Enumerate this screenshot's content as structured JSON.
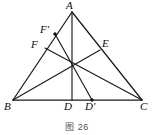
{
  "figure": {
    "caption": "图 26",
    "stroke_color": "#1a1a1a",
    "background_color": "#ffffff",
    "point_marker_color": "#111111",
    "labels": {
      "A": "A",
      "B": "B",
      "C": "C",
      "D": "D",
      "D_prime": "D'",
      "E": "E",
      "F": "F",
      "F_prime": "F'"
    },
    "points": [
      {
        "name": "A",
        "label": "A",
        "x": 72,
        "y": 12,
        "label_x": 68,
        "label_y": 0,
        "marker": false
      },
      {
        "name": "B",
        "label": "B",
        "x": 13,
        "y": 100,
        "label_x": 6,
        "label_y": 102,
        "marker": false
      },
      {
        "name": "C",
        "label": "C",
        "x": 142,
        "y": 100,
        "label_x": 141,
        "label_y": 102,
        "marker": false
      },
      {
        "name": "D",
        "label": "D",
        "x": 72,
        "y": 100,
        "label_x": 66,
        "label_y": 102,
        "marker": false
      },
      {
        "name": "D'",
        "label": "D'",
        "x": 92,
        "y": 100,
        "label_x": 87,
        "label_y": 102,
        "marker": true
      },
      {
        "name": "E",
        "label": "E",
        "x": 100,
        "y": 50,
        "label_x": 103,
        "label_y": 40,
        "marker": false
      },
      {
        "name": "F",
        "label": "F",
        "x": 45,
        "y": 48,
        "label_x": 33,
        "label_y": 40,
        "marker": false
      },
      {
        "name": "F'",
        "label": "F'",
        "x": 55,
        "y": 34,
        "label_x": 42,
        "label_y": 25,
        "marker": true
      }
    ],
    "segments": [
      {
        "name": "side-AB",
        "from": "A",
        "to": "B"
      },
      {
        "name": "side-AC",
        "from": "A",
        "to": "C"
      },
      {
        "name": "side-BC",
        "from": "B",
        "to": "C"
      },
      {
        "name": "median-AD",
        "from": "A",
        "to": "D"
      },
      {
        "name": "cevian-BE",
        "from": "B",
        "to": "E"
      },
      {
        "name": "cevian-CF",
        "from": "C",
        "to": "F"
      },
      {
        "name": "segment-FprimeDprime",
        "from": "F'",
        "to": "D'"
      }
    ],
    "centroid": {
      "x": 72,
      "y": 68
    }
  }
}
